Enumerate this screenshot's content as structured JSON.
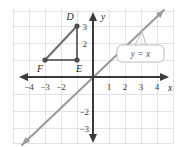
{
  "figure": {
    "colors": {
      "grid": "#e3e3e5",
      "axis": "#3b3b3b",
      "line": "#9b9b9b",
      "shape": "#6d6e71",
      "vertex": "#4d4d4f",
      "callout_border": "#bcbcbc",
      "callout_fill": "#ffffff",
      "background": "#ffffff",
      "label_text": "#231f20"
    },
    "axes": {
      "x_axis_label": "x",
      "y_axis_label": "y",
      "x_ticks": [
        "−4",
        "−3",
        "−2",
        "1",
        "2",
        "3",
        "4"
      ],
      "x_tick_values": [
        -4,
        -3,
        -2,
        1,
        2,
        3,
        4
      ],
      "y_ticks": [
        "3",
        "2",
        "−2",
        "−3"
      ],
      "y_tick_values": [
        3,
        2,
        -2,
        -3
      ],
      "xlim": [
        -5,
        5
      ],
      "ylim": [
        -4,
        4
      ],
      "grid": true
    },
    "line": {
      "equation": "y = x",
      "slope": 1,
      "intercept": 0,
      "arrows": "both"
    },
    "callout": {
      "text": "y = x",
      "points_to": "line"
    },
    "shape": {
      "name": "triangle",
      "vertices": [
        {
          "label": "D",
          "x": -1,
          "y": 3
        },
        {
          "label": "E",
          "x": -1,
          "y": 1
        },
        {
          "label": "F",
          "x": -3,
          "y": 1
        }
      ]
    }
  }
}
